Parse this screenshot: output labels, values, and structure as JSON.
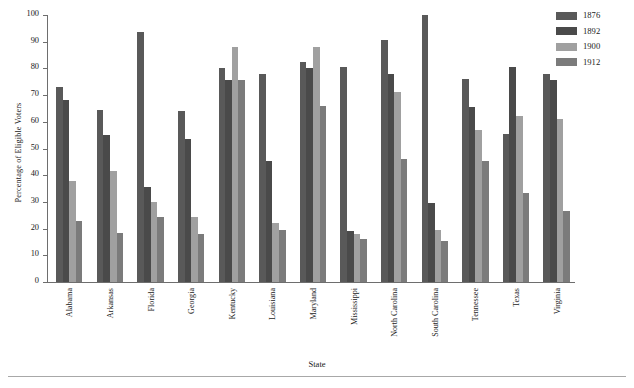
{
  "chart_data": {
    "type": "bar",
    "title": "",
    "xlabel": "State",
    "ylabel": "Percentage of Eligible Voters",
    "ylim": [
      0,
      100
    ],
    "ytick_step": 10,
    "yticks": [
      100,
      90,
      80,
      70,
      60,
      50,
      40,
      30,
      20,
      10,
      0
    ],
    "grid": false,
    "legend_position": "top-right",
    "categories": [
      "Alabama",
      "Arkansas",
      "Florida",
      "Georgia",
      "Kentucky",
      "Louisiana",
      "Maryland",
      "Mississippi",
      "North Carolina",
      "South Carolina",
      "Tennessee",
      "Texas",
      "Virginia"
    ],
    "series": [
      {
        "name": "1876",
        "color": "#595959",
        "values": [
          73,
          64.5,
          93.5,
          64,
          80,
          78,
          82.5,
          80.5,
          90.5,
          100,
          76,
          55.5,
          78
        ]
      },
      {
        "name": "1892",
        "color": "#4a4a4a",
        "values": [
          68,
          55,
          35.5,
          53.5,
          75.5,
          45.5,
          80,
          19,
          78,
          29.5,
          65.5,
          80.5,
          75.5
        ]
      },
      {
        "name": "1900",
        "color": "#a0a0a0",
        "values": [
          38,
          41.5,
          30,
          24.5,
          88,
          22,
          88,
          18,
          71,
          19.5,
          57,
          62,
          61
        ]
      },
      {
        "name": "1912",
        "color": "#7b7b7b",
        "values": [
          23,
          18.5,
          24.5,
          18,
          75.5,
          19.5,
          66,
          16,
          46,
          15.5,
          45.5,
          33.5,
          26.5
        ]
      }
    ]
  },
  "legend": {
    "entries": [
      {
        "label": "1876",
        "color": "#595959"
      },
      {
        "label": "1892",
        "color": "#4a4a4a"
      },
      {
        "label": "1900",
        "color": "#a0a0a0"
      },
      {
        "label": "1912",
        "color": "#7b7b7b"
      }
    ]
  },
  "axes": {
    "y_title": "Percentage of Eligible Voters",
    "x_title": "State"
  }
}
